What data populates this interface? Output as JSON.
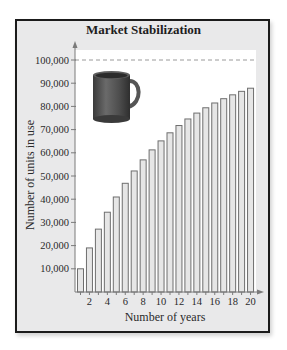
{
  "chart_data": {
    "type": "bar",
    "title": "Market Stabilization",
    "xlabel": "Number of years",
    "ylabel": "Number of units in use",
    "categories": [
      1,
      2,
      3,
      4,
      5,
      6,
      7,
      8,
      9,
      10,
      11,
      12,
      13,
      14,
      15,
      16,
      17,
      18,
      19,
      20
    ],
    "x_tick_labels": [
      "2",
      "4",
      "6",
      "8",
      "10",
      "12",
      "14",
      "16",
      "18",
      "20"
    ],
    "y_tick_labels": [
      "10,000",
      "20,000",
      "30,000",
      "40,000",
      "50,000",
      "60,000",
      "70,000",
      "80,000",
      "90,000",
      "100,000"
    ],
    "values": [
      10000,
      19000,
      27100,
      34390,
      40951,
      46856,
      52170,
      56953,
      61258,
      65132,
      68619,
      71757,
      74581,
      77123,
      79411,
      81470,
      83323,
      84991,
      86491,
      87842
    ],
    "ylim": [
      0,
      100000
    ],
    "asymptote": {
      "value": 100000,
      "style": "dashed"
    },
    "grid": false,
    "legend": null,
    "illustration": "coffee-mug"
  },
  "colors": {
    "frame_bg": "#e9e9ea",
    "plot_bg": "#ffffff",
    "bar_fill": "#e6e6e6",
    "bar_stroke": "#6e6e6e",
    "axis": "#7a7a7a",
    "dash": "#9a9a9a",
    "mug": "#5a5a5a"
  }
}
